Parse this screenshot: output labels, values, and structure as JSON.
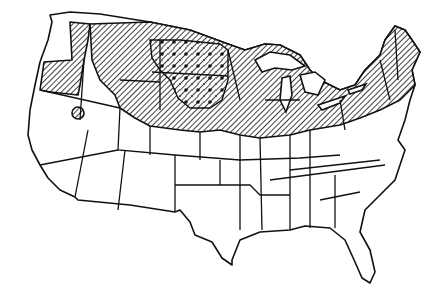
{
  "map": {
    "title": "",
    "region": "Continental United States",
    "colors": {
      "ink": "#111111",
      "background": "#ffffff"
    },
    "legend": [],
    "zones": [
      {
        "name": "hatched-zone",
        "pattern": "diagonal-hatch",
        "states": [
          "WA-east",
          "OR",
          "ID",
          "MT",
          "WY",
          "ND",
          "SD",
          "NE",
          "MN",
          "IA",
          "WI",
          "MI",
          "IL",
          "IN",
          "OH",
          "PA",
          "NY",
          "VT",
          "NH",
          "ME",
          "MA",
          "CT",
          "RI",
          "NJ"
        ]
      },
      {
        "name": "dotted-zone",
        "pattern": "diagonal-hatch-with-dots",
        "states": [
          "ND",
          "SD",
          "MT-east",
          "NE-north"
        ]
      },
      {
        "name": "isolated-patch",
        "pattern": "diagonal-hatch",
        "location": "northern Nevada"
      }
    ]
  }
}
